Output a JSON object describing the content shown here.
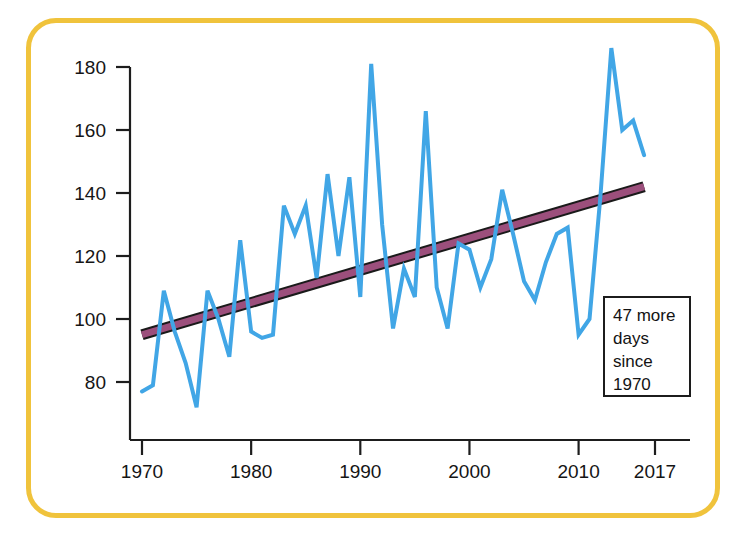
{
  "figure": {
    "border_color": "#f0c33c",
    "background": "#ffffff"
  },
  "annotation": {
    "name": "callout-box",
    "line1": "47 more",
    "line2": "days",
    "line3": "since",
    "line4": "1970"
  },
  "chart_data": {
    "type": "line",
    "title": "",
    "subtitle": "",
    "xlabel": "",
    "ylabel": "",
    "xlim": [
      1970,
      2017
    ],
    "ylim": [
      68,
      190
    ],
    "grid": false,
    "legend_position": "none",
    "y_ticks": [
      80,
      100,
      120,
      140,
      160,
      180
    ],
    "y_tick_labels": [
      "80",
      "100",
      "120",
      "140",
      "160",
      "180"
    ],
    "x_ticks": [
      1970,
      1980,
      1990,
      2000,
      2010,
      2017
    ],
    "x_tick_labels": [
      "1970",
      "1980",
      "1990",
      "2000",
      "2010",
      "2017"
    ],
    "series": [
      {
        "name": "annual-value",
        "type": "line",
        "color": "#41a6e6",
        "width": 4,
        "x": [
          1970,
          1971,
          1972,
          1973,
          1974,
          1975,
          1976,
          1977,
          1978,
          1979,
          1980,
          1981,
          1982,
          1983,
          1984,
          1985,
          1986,
          1987,
          1988,
          1989,
          1990,
          1991,
          1992,
          1993,
          1994,
          1995,
          1996,
          1997,
          1998,
          1999,
          2000,
          2001,
          2002,
          2003,
          2004,
          2005,
          2006,
          2007,
          2008,
          2009,
          2010,
          2011,
          2012,
          2013,
          2014,
          2015,
          2016
        ],
        "values": [
          77,
          79,
          109,
          96,
          86,
          72,
          109,
          100,
          88,
          125,
          96,
          94,
          95,
          136,
          127,
          136,
          113,
          146,
          120,
          145,
          107,
          181,
          130,
          97,
          116,
          107,
          166,
          110,
          97,
          124,
          122,
          110,
          119,
          141,
          127,
          112,
          106,
          118,
          127,
          129,
          95,
          100,
          139,
          186,
          160,
          163,
          152
        ]
      },
      {
        "name": "trend-line",
        "type": "line",
        "color": "#9c4f7c",
        "outline_color": "#1a1a1a",
        "width": 7,
        "x": [
          1970,
          2016
        ],
        "values": [
          95,
          142
        ]
      }
    ],
    "annotations": [
      {
        "text": "47 more days since 1970",
        "x": 2012,
        "y": 103
      }
    ]
  }
}
